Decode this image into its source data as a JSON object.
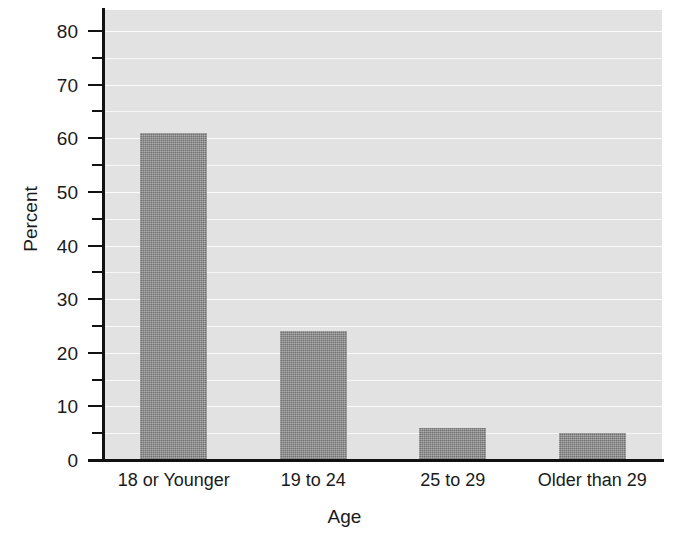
{
  "chart_data": {
    "type": "bar",
    "title": "",
    "xlabel": "Age",
    "ylabel": "Percent",
    "categories": [
      "18 or Younger",
      "19 to 24",
      "25 to 29",
      "Older than 29"
    ],
    "values": [
      61,
      24,
      6,
      5
    ],
    "ylim": [
      0,
      80
    ],
    "xlim_note": "categorical",
    "y_major_ticks": [
      0,
      10,
      20,
      30,
      40,
      50,
      60,
      70,
      80
    ],
    "y_minor_ticks": [
      5,
      15,
      25,
      35,
      45,
      55,
      65,
      75
    ],
    "y_tick_labels": [
      "0",
      "10",
      "20",
      "30",
      "40",
      "50",
      "60",
      "70",
      "80"
    ],
    "grid": "horizontal gridlines every 5 units, white on light gray plot background",
    "legend": "none",
    "series": [
      {
        "name": "Percent",
        "values": [
          61,
          24,
          6,
          5
        ]
      }
    ]
  },
  "style": {
    "plot_background": "#e2e2e2",
    "bar_color": "#8c8c8c",
    "gridline_color": "#f7f7f7",
    "axis_color": "#111111",
    "text_color": "#1a1a1a",
    "page_background": "#ffffff"
  }
}
